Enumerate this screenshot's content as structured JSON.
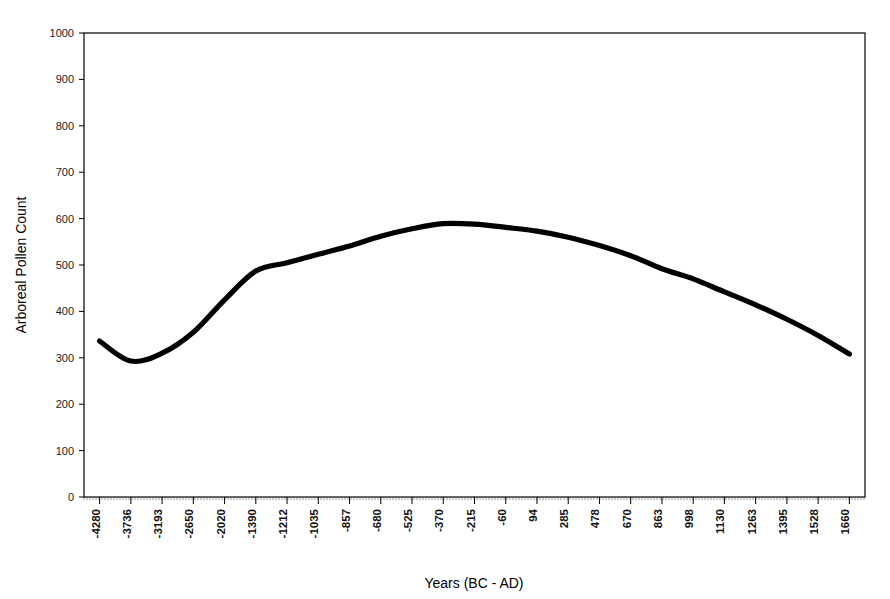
{
  "chart_data": {
    "type": "line",
    "title": "",
    "xlabel": "Years (BC - AD)",
    "ylabel": "Arboreal Pollen Count",
    "xlim": [
      -4280,
      1660
    ],
    "ylim": [
      0,
      1000
    ],
    "grid": false,
    "legend": "none",
    "line_color": "#000000",
    "categories": [
      "-4280",
      "-3736",
      "-3193",
      "-2650",
      "-2020",
      "-1390",
      "-1212",
      "-1035",
      "-857",
      "-680",
      "-525",
      "-370",
      "-215",
      "-60",
      "94",
      "285",
      "478",
      "670",
      "863",
      "998",
      "1130",
      "1263",
      "1395",
      "1528",
      "1660"
    ],
    "x": [
      -4280,
      -3736,
      -3193,
      -2650,
      -2020,
      -1390,
      -1212,
      -1035,
      -857,
      -680,
      -525,
      -370,
      -215,
      -60,
      94,
      285,
      478,
      670,
      863,
      998,
      1130,
      1263,
      1395,
      1528,
      1660
    ],
    "values": [
      336,
      293,
      310,
      355,
      425,
      487,
      505,
      523,
      541,
      562,
      578,
      589,
      588,
      581,
      573,
      560,
      542,
      520,
      492,
      470,
      442,
      414,
      383,
      348,
      308
    ],
    "series": [
      {
        "name": "Arboreal Pollen Count",
        "values": [
          336,
          293,
          310,
          355,
          425,
          487,
          505,
          523,
          541,
          562,
          578,
          589,
          588,
          581,
          573,
          560,
          542,
          520,
          492,
          470,
          442,
          414,
          383,
          348,
          308
        ]
      }
    ],
    "y_ticks": [
      "0",
      "100",
      "200",
      "300",
      "400",
      "500",
      "600",
      "700",
      "800",
      "900",
      "1000"
    ],
    "y_tick_values": [
      0,
      100,
      200,
      300,
      400,
      500,
      600,
      700,
      800,
      900,
      1000
    ]
  },
  "axes": {
    "y_label": "Arboreal Pollen Count",
    "x_label": "Years (BC - AD)"
  }
}
